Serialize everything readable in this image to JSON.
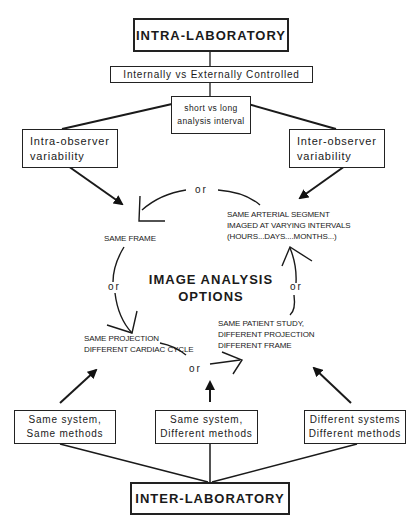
{
  "diagram": {
    "top": {
      "title": "INTRA-LABORATORY"
    },
    "control": {
      "label": "Internally vs Externally Controlled"
    },
    "interval": {
      "line1": "short vs long",
      "line2": "analysis interval"
    },
    "intra_observer": {
      "line1": "Intra-observer",
      "line2": "variability"
    },
    "inter_observer": {
      "line1": "Inter-observer",
      "line2": "variability"
    },
    "center": {
      "line1": "IMAGE ANALYSIS",
      "line2": "OPTIONS"
    },
    "options": {
      "same_frame": "SAME FRAME",
      "same_segment": [
        "SAME ARTERIAL SEGMENT",
        "IMAGED AT VARYING INTERVALS",
        "(HOURS...DAYS....MONTHS...)"
      ],
      "same_projection": [
        "SAME PROJECTION",
        "DIFFERENT CARDIAC CYCLE"
      ],
      "same_patient": [
        "SAME PATIENT STUDY,",
        "DIFFERENT PROJECTION",
        "DIFFERENT FRAME"
      ]
    },
    "connector_word": "or",
    "bottom_boxes": [
      {
        "line1": "Same system,",
        "line2": "Same methods"
      },
      {
        "line1": "Same system,",
        "line2": "Different methods"
      },
      {
        "line1": "Different systems",
        "line2": "Different methods"
      }
    ],
    "bottom": {
      "title": "INTER-LABORATORY"
    }
  }
}
